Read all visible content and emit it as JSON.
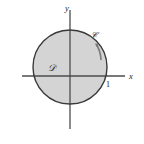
{
  "figure": {
    "background_color": "#ffffff",
    "axes": {
      "x_label": "x",
      "y_label": "y",
      "axis_color": "#4d4d4d",
      "x_axis_start": [
        22,
        76
      ],
      "x_axis_end": [
        125,
        76
      ],
      "y_axis_start": [
        70,
        10
      ],
      "y_axis_end": [
        70,
        129
      ],
      "ticks": [
        {
          "label": "1",
          "axis": "x",
          "value": 1,
          "position": [
            108,
            76
          ]
        }
      ]
    },
    "region": {
      "label": "D",
      "label_glyph": "𝒟",
      "description": "shaded disk",
      "fill_color": "#d4d4d4",
      "stroke_color": "#3a3a3a",
      "center": [
        70,
        67
      ],
      "radius": 37,
      "radius_value": 1,
      "label_position": [
        52,
        68
      ]
    },
    "curve": {
      "label": "C",
      "label_glyph": "𝒞",
      "description": "boundary circle with counterclockwise orientation arrow",
      "orientation": "counterclockwise",
      "stroke_color": "#3a3a3a",
      "label_position": [
        93,
        35
      ],
      "arrow_color": "#6a6a6a"
    }
  }
}
